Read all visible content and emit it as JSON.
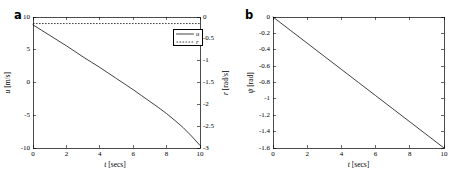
{
  "figure": {
    "width": 466,
    "height": 179,
    "background": "#ffffff",
    "ink_color": "#000000"
  },
  "panels": {
    "a": {
      "letter": "a",
      "xlabel_var": "t",
      "xlabel_unit": "[secs]",
      "left_ylabel_var": "u",
      "left_ylabel_unit": "[m/s]",
      "right_ylabel_var": "r",
      "right_ylabel_unit": "[rad/s]",
      "xticks": [
        "0",
        "2",
        "4",
        "6",
        "8",
        "10"
      ],
      "left_yticks": [
        "10",
        "5",
        "0",
        "-5",
        "-10"
      ],
      "right_yticks": [
        "0",
        "-0.5",
        "-1",
        "-1.5",
        "-2",
        "-2.5",
        "-3"
      ],
      "legend": [
        {
          "label": "u",
          "style": "solid"
        },
        {
          "label": "r",
          "style": "dotted"
        }
      ]
    },
    "b": {
      "letter": "b",
      "xlabel_var": "t",
      "xlabel_unit": "[secs]",
      "ylabel_var": "ψ",
      "ylabel_unit": "[rad]",
      "xticks": [
        "0",
        "2",
        "4",
        "6",
        "8",
        "10"
      ],
      "yticks": [
        "0",
        "-0.2",
        "-0.4",
        "-0.6",
        "-0.8",
        "-1",
        "-1.2",
        "-1.4",
        "-1.6"
      ]
    }
  },
  "chart_data": [
    {
      "type": "line",
      "panel": "a",
      "title": "",
      "xlabel": "t [secs]",
      "ylabel": "u [m/s]",
      "y2label": "r [rad/s]",
      "xlim": [
        0,
        10
      ],
      "ylim": [
        -10,
        10
      ],
      "y2lim": [
        -3,
        0
      ],
      "xticks": [
        0,
        2,
        4,
        6,
        8,
        10
      ],
      "yticks": [
        10,
        5,
        0,
        -5,
        -10
      ],
      "y2ticks": [
        0,
        -0.5,
        -1,
        -1.5,
        -2,
        -2.5,
        -3
      ],
      "grid": false,
      "legend": [
        "u",
        "r"
      ],
      "legend_position": "upper right",
      "series": [
        {
          "name": "u",
          "axis": "left",
          "style": "solid",
          "x": [
            0,
            0.5,
            1,
            1.5,
            2,
            2.5,
            3,
            3.5,
            4,
            4.5,
            5,
            5.5,
            6,
            6.5,
            7,
            7.5,
            8,
            8.5,
            9,
            9.5,
            10
          ],
          "values": [
            8.8,
            8.0,
            7.2,
            6.4,
            5.6,
            4.75,
            3.9,
            3.1,
            2.3,
            1.45,
            0.6,
            -0.25,
            -1.1,
            -2.0,
            -2.9,
            -3.8,
            -4.75,
            -5.8,
            -6.9,
            -8.2,
            -9.6
          ]
        },
        {
          "name": "r",
          "axis": "right",
          "style": "dotted",
          "x": [
            0,
            1,
            2,
            3,
            4,
            5,
            6,
            7,
            8,
            9,
            10
          ],
          "values": [
            -0.15,
            -0.15,
            -0.15,
            -0.15,
            -0.15,
            -0.15,
            -0.15,
            -0.15,
            -0.15,
            -0.15,
            -0.15
          ]
        }
      ]
    },
    {
      "type": "line",
      "panel": "b",
      "title": "",
      "xlabel": "t [secs]",
      "ylabel": "ψ [rad]",
      "xlim": [
        0,
        10
      ],
      "ylim": [
        -1.6,
        0
      ],
      "xticks": [
        0,
        2,
        4,
        6,
        8,
        10
      ],
      "yticks": [
        0,
        -0.2,
        -0.4,
        -0.6,
        -0.8,
        -1,
        -1.2,
        -1.4,
        -1.6
      ],
      "grid": false,
      "legend": [],
      "series": [
        {
          "name": "ψ",
          "axis": "left",
          "style": "solid",
          "x": [
            0,
            1,
            2,
            3,
            4,
            5,
            6,
            7,
            8,
            9,
            10
          ],
          "values": [
            0,
            -0.16,
            -0.32,
            -0.48,
            -0.64,
            -0.8,
            -0.96,
            -1.12,
            -1.28,
            -1.44,
            -1.6
          ]
        }
      ]
    }
  ]
}
